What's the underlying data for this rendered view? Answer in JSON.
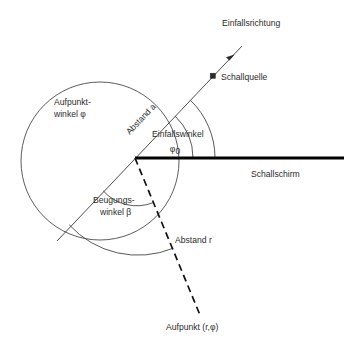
{
  "diagram": {
    "title_visible": false,
    "background_color": "#ffffff",
    "ink_color": "#2b2b2b",
    "barrier_color": "#000000",
    "labels": {
      "incidence_direction": "Einfallsrichtung",
      "sound_source": "Schallquelle",
      "distance_a": "Abstand a",
      "incidence_angle_line1": "Einfallswinkel",
      "incidence_angle_symbol": "φ",
      "incidence_angle_subscript": "0",
      "sound_barrier": "Schallschirm",
      "field_point_angle_line1": "Aufpunkt-",
      "field_point_angle_line2": "winkel φ",
      "diffraction_angle_line1": "Beugungs-",
      "diffraction_angle_line2": "winkel β",
      "distance_r": "Abstand r",
      "field_point": "Aufpunkt (r,φ)"
    },
    "geometry": {
      "vertex": {
        "x": 135,
        "y": 158
      },
      "source": {
        "x": 213,
        "y": 76
      },
      "circle": {
        "cx": 100,
        "cy": 161,
        "r": 79
      },
      "barrier": {
        "x1": 135,
        "y1": 158,
        "x2": 344,
        "y2": 158
      },
      "incidence_ray": {
        "x1": 242,
        "y1": 46,
        "x2": 57,
        "y2": 241
      },
      "field_ray": {
        "x1": 135,
        "y1": 158,
        "x2": 200,
        "y2": 315
      },
      "arrow_tip": {
        "x": 232,
        "y": 57
      },
      "arc_inner_radius": 58,
      "arc_outer_radius": 80,
      "arc_diffraction_inner_radius": 45,
      "arc_diffraction_outer_radius": 93
    }
  }
}
